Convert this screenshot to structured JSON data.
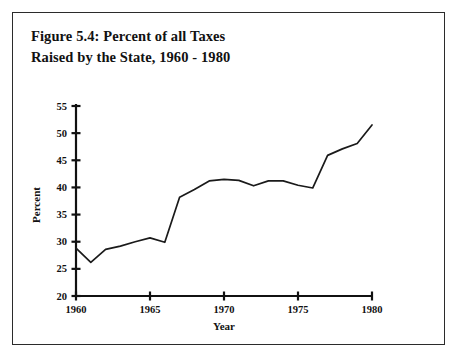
{
  "figure": {
    "caption_line1": "Figure 5.4: Percent of all Taxes",
    "caption_line2": "Raised by the State, 1960 - 1980"
  },
  "colors": {
    "line": "#1a1a1a",
    "axis": "#111111",
    "frame": "#2b2b2b",
    "background": "#ffffff"
  },
  "chart_data": {
    "type": "line",
    "title": "Figure 5.4: Percent of all Taxes Raised by the State, 1960 - 1980",
    "xlabel": "Year",
    "ylabel": "Percent",
    "xlim": [
      1960,
      1980
    ],
    "ylim": [
      20,
      55
    ],
    "xticks": [
      1960,
      1965,
      1970,
      1975,
      1980
    ],
    "xtick_labels": [
      "1960",
      "1965",
      "1970",
      "1975",
      "1980"
    ],
    "yticks": [
      20,
      25,
      30,
      35,
      40,
      45,
      50,
      55
    ],
    "ytick_labels": [
      "20",
      "25",
      "30",
      "35",
      "40",
      "45",
      "50",
      "55"
    ],
    "grid": false,
    "legend": false,
    "x": [
      1960,
      1961,
      1962,
      1963,
      1964,
      1965,
      1966,
      1967,
      1968,
      1969,
      1970,
      1971,
      1972,
      1973,
      1974,
      1975,
      1976,
      1977,
      1978,
      1979,
      1980
    ],
    "values": [
      28.8,
      26.2,
      28.6,
      29.2,
      30.0,
      30.7,
      29.9,
      38.2,
      39.6,
      41.2,
      41.5,
      41.3,
      40.3,
      41.2,
      41.2,
      40.4,
      39.9,
      45.9,
      47.1,
      48.1,
      51.5
    ],
    "series": [
      {
        "name": "Percent of all taxes raised by the state",
        "values": [
          28.8,
          26.2,
          28.6,
          29.2,
          30.0,
          30.7,
          29.9,
          38.2,
          39.6,
          41.2,
          41.5,
          41.3,
          40.3,
          41.2,
          41.2,
          40.4,
          39.9,
          45.9,
          47.1,
          48.1,
          51.5
        ]
      }
    ]
  }
}
